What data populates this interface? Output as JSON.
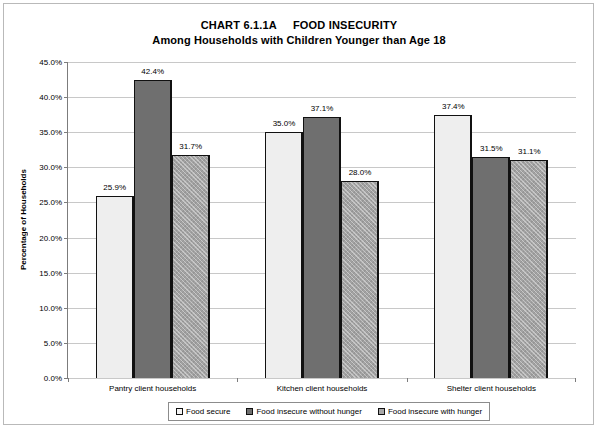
{
  "chart_data": {
    "type": "bar",
    "title": "CHART 6.1.1A     FOOD INSECURITY",
    "subtitle": "Among Households with Children Younger than Age 18",
    "xlabel": "",
    "ylabel": "Percentage of Households",
    "ylim": [
      0,
      45
    ],
    "ytick_step": 5,
    "ytick_labels": [
      "0.0%",
      "5.0%",
      "10.0%",
      "15.0%",
      "20.0%",
      "25.0%",
      "30.0%",
      "35.0%",
      "40.0%",
      "45.0%"
    ],
    "ytick_values": [
      0,
      5,
      10,
      15,
      20,
      25,
      30,
      35,
      40,
      45
    ],
    "grid": true,
    "legend_position": "bottom",
    "categories": [
      "Pantry client households",
      "Kitchen client households",
      "Shelter client households"
    ],
    "series": [
      {
        "name": "Food secure",
        "fill": "light-gray",
        "color": "#eeeeee",
        "values": [
          25.9,
          35.0,
          37.4
        ],
        "labels": [
          "25.9%",
          "35.0%",
          "37.4%"
        ]
      },
      {
        "name": "Food insecure without hunger",
        "fill": "dark-gray",
        "color": "#6f6f6f",
        "values": [
          42.4,
          37.1,
          31.5
        ],
        "labels": [
          "42.4%",
          "37.1%",
          "31.5%"
        ]
      },
      {
        "name": "Food insecure with hunger",
        "fill": "medium-gray-hatch",
        "color": "#a2a2a2",
        "values": [
          31.7,
          28.0,
          31.1
        ],
        "labels": [
          "31.7%",
          "28.0%",
          "31.1%"
        ]
      }
    ]
  },
  "colors": {
    "axis": "#7c7c7c",
    "gridline": "#c8c8c8",
    "bar_outline": "#111111",
    "frame": "#b9b9b9",
    "text": "#000000"
  }
}
